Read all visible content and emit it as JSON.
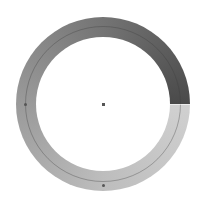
{
  "widget": {
    "type": "ring-gradient",
    "center": {
      "x": 103,
      "y": 104
    },
    "outer_radius": 87,
    "inner_radius": 67,
    "guide_radius": 78,
    "gradient_start_angle_deg": 90,
    "colors": {
      "start": "#d0d0d0",
      "quarter": "#bdbdbd",
      "half": "#9a9a9a",
      "three_quarter": "#747474",
      "end": "#4a4a4a",
      "guide_line": "#555555",
      "background": "#ffffff"
    },
    "markers": [
      {
        "name": "left-marker",
        "x": 25,
        "y": 104
      },
      {
        "name": "bottom-marker",
        "x": 103,
        "y": 185
      }
    ]
  }
}
